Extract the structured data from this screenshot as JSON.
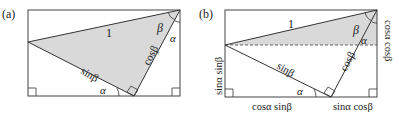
{
  "panels": [
    {
      "id": "a",
      "label": "(a)",
      "hypotenuse": "1",
      "side_left": "sinβ",
      "side_right": "cosβ",
      "angle_top": "β",
      "angle_top_right": "α",
      "angle_bottom": "α"
    },
    {
      "id": "b",
      "label": "(b)",
      "hypotenuse": "1",
      "side_left": "sinβ",
      "side_right": "cosβ",
      "angle_top": "β",
      "angle_right_inner": "α",
      "angle_bottom": "α",
      "left_edge": "sinα sinβ",
      "right_edge": "cosα cosβ",
      "bottom_left": "cosα sinβ",
      "bottom_right": "sinα cosβ"
    }
  ],
  "colors": {
    "stroke": "#333333",
    "shade": "#d9d9d9"
  }
}
